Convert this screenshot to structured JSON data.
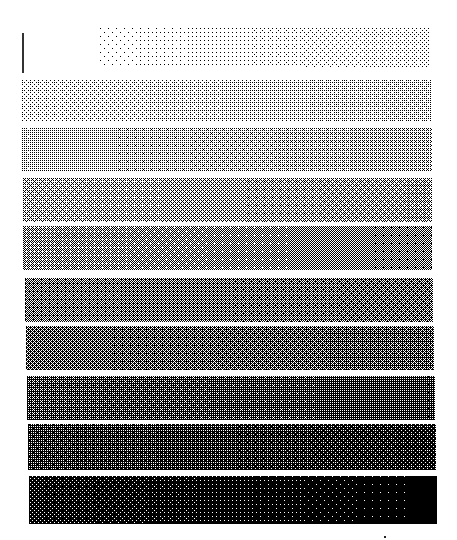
{
  "figure": {
    "background": "#ffffff",
    "ink": "#000000",
    "vertical_marker": {
      "x": 22,
      "y": 33,
      "height": 40
    },
    "bands": [
      {
        "index": 0,
        "x": 100,
        "y": 28,
        "w": 330,
        "h": 40,
        "density_start": 0.03,
        "density_end": 0.12
      },
      {
        "index": 1,
        "x": 22,
        "y": 80,
        "w": 410,
        "h": 42,
        "density_start": 0.14,
        "density_end": 0.22
      },
      {
        "index": 2,
        "x": 22,
        "y": 128,
        "w": 410,
        "h": 44,
        "density_start": 0.24,
        "density_end": 0.32
      },
      {
        "index": 3,
        "x": 23,
        "y": 178,
        "w": 409,
        "h": 44,
        "density_start": 0.34,
        "density_end": 0.42
      },
      {
        "index": 4,
        "x": 23,
        "y": 226,
        "w": 409,
        "h": 44,
        "density_start": 0.44,
        "density_end": 0.52
      },
      {
        "index": 5,
        "x": 25,
        "y": 278,
        "w": 408,
        "h": 44,
        "density_start": 0.54,
        "density_end": 0.6
      },
      {
        "index": 6,
        "x": 26,
        "y": 326,
        "w": 408,
        "h": 44,
        "density_start": 0.62,
        "density_end": 0.68
      },
      {
        "index": 7,
        "x": 27,
        "y": 376,
        "w": 408,
        "h": 44,
        "density_start": 0.7,
        "density_end": 0.76
      },
      {
        "index": 8,
        "x": 28,
        "y": 424,
        "w": 408,
        "h": 46,
        "density_start": 0.78,
        "density_end": 0.86
      },
      {
        "index": 9,
        "x": 29,
        "y": 476,
        "w": 408,
        "h": 48,
        "density_start": 0.88,
        "density_end": 1.0
      }
    ]
  }
}
